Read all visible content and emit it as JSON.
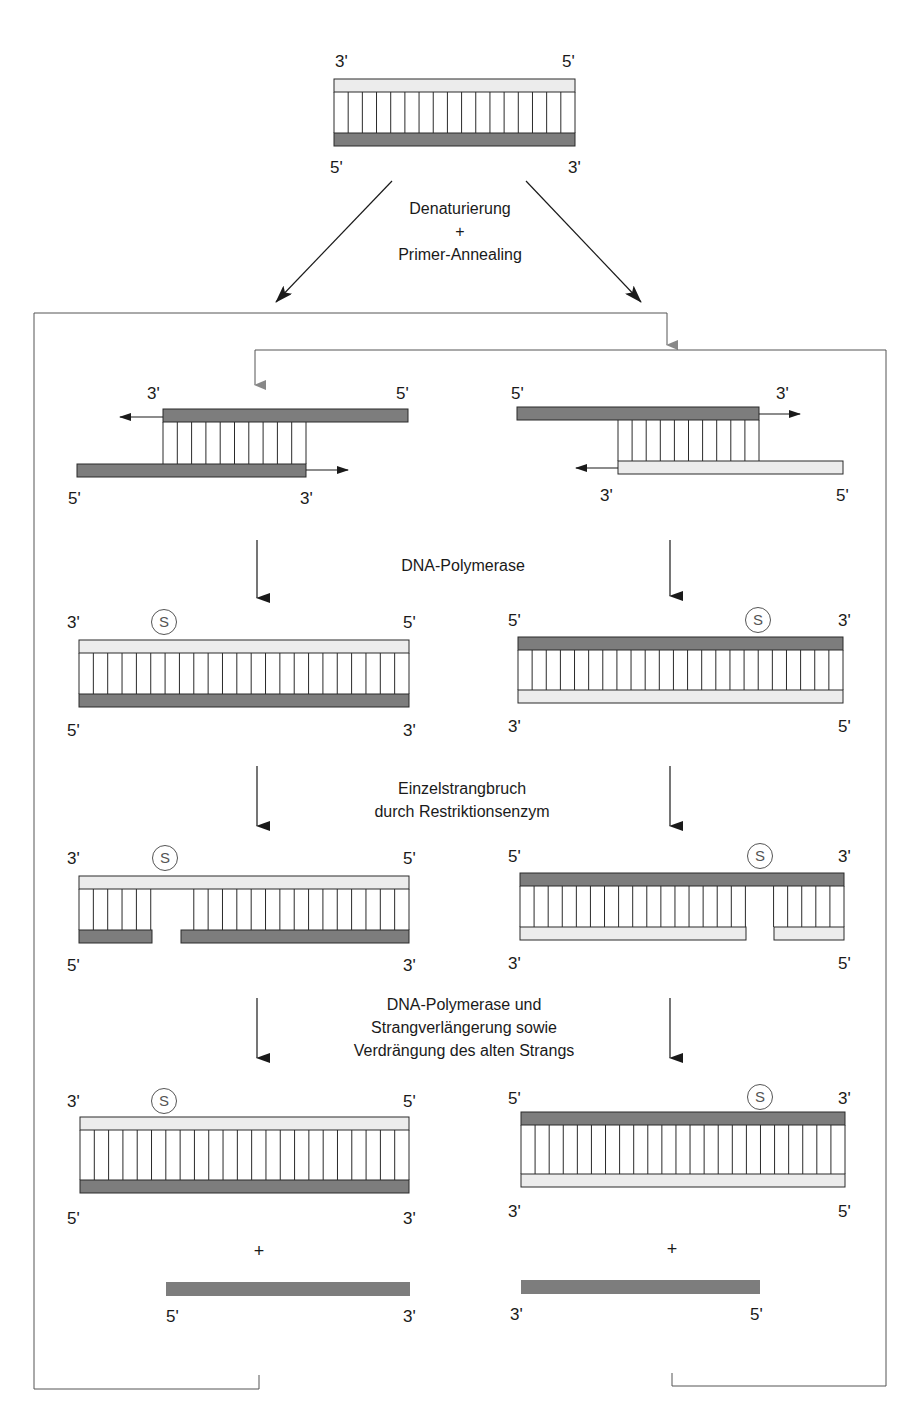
{
  "colors": {
    "dark_strand": "#7d7d7d",
    "light_strand": "#ececec",
    "stroke": "#2a2a2a",
    "feedback_arrow": "#888888"
  },
  "labels": {
    "three_prime": "3'",
    "five_prime": "5'",
    "plus": "+",
    "site_marker": "S"
  },
  "steps": {
    "step1": {
      "line1": "Denaturierung",
      "line2": "+",
      "line3": "Primer-Annealing"
    },
    "step2": {
      "line1": "DNA-Polymerase"
    },
    "step3": {
      "line1": "Einzelstrangbruch",
      "line2": "durch Restriktionsenzym"
    },
    "step4": {
      "line1": "DNA-Polymerase und",
      "line2": "Strangverlängerung sowie",
      "line3": "Verdrängung des alten Strangs"
    }
  },
  "stages": [
    {
      "name": "template-duplex",
      "top": "3' light",
      "bottom": "5' dark"
    },
    {
      "name": "primer-annealed",
      "left": "template + primer with extension arrows",
      "right": "template + primer with extension arrows"
    },
    {
      "name": "extended-duplex-with-site",
      "marker": "S"
    },
    {
      "name": "nicked-duplex",
      "marker": "S"
    },
    {
      "name": "displacement-product",
      "marker": "S",
      "released_strand": true
    }
  ]
}
